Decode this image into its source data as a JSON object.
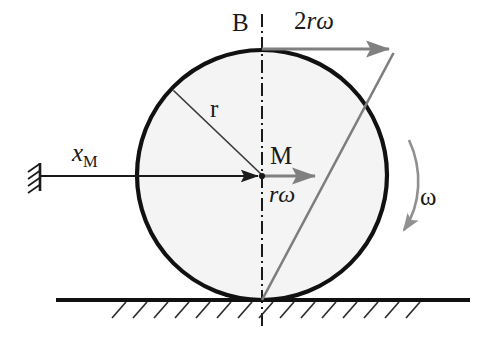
{
  "figure": {
    "type": "mechanics-diagram",
    "colors": {
      "outline": "#111111",
      "disc_fill": "#f4f4f4",
      "vector_gray": "#808080",
      "axis_black": "#1a1a1a",
      "background": "#ffffff"
    }
  },
  "labels": {
    "point_top": "B",
    "point_center": "M",
    "velocity_top": {
      "coefficient": "2",
      "radius_symbol": "r",
      "omega_symbol": "ω",
      "text": "2rω"
    },
    "velocity_center": {
      "radius_symbol": "r",
      "omega_symbol": "ω",
      "text": "rω"
    },
    "displacement": {
      "symbol": "x",
      "subscript": "M",
      "text": "x_M"
    },
    "radius": "r",
    "angular_velocity": "ω"
  },
  "geometry": {
    "disc": {
      "cx": 262,
      "cy": 175,
      "r": 125
    },
    "contact_point": {
      "x": 262,
      "y": 300
    },
    "top_point": {
      "x": 262,
      "y": 50
    },
    "ground_line": {
      "x1": 56,
      "x2": 470,
      "y": 300
    },
    "center_axis": {
      "x": 262,
      "y1": 14,
      "y2": 326
    },
    "wall_support": {
      "x": 40,
      "y_top": 164,
      "y_bottom": 190
    },
    "vector_xM": {
      "x1": 40,
      "y1": 176,
      "x2": 262,
      "y2": 176
    },
    "vector_romega": {
      "x1": 262,
      "y1": 176,
      "x2": 321,
      "y2": 176
    },
    "vector_2romega": {
      "x1": 262,
      "y1": 49,
      "x2": 395,
      "y2": 49
    },
    "velocity_profile_line": {
      "x1": 262,
      "y1": 300,
      "x2": 393,
      "y2": 54
    },
    "radius_line": {
      "x1": 262,
      "y1": 175,
      "x2": 173,
      "y2": 90
    },
    "omega_arc": {
      "start_x": 410,
      "start_y": 140,
      "end_x": 403,
      "end_y": 235
    }
  }
}
